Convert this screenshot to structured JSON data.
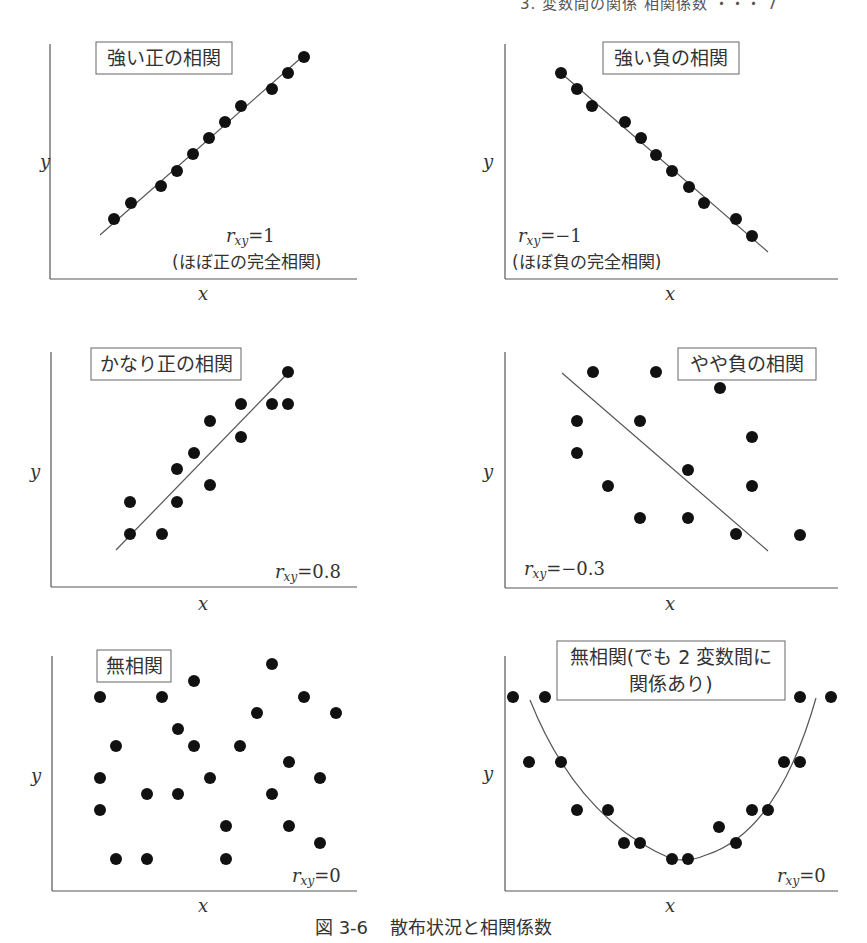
{
  "header": {
    "running_title": "3. 変数間の関係 相関係数 ・・・ 7"
  },
  "caption": {
    "number": "図 3-6",
    "text": "散布状況と相関係数"
  },
  "chart_data": [
    {
      "type": "scatter",
      "title": "強い正の相関",
      "annotation": "r_xy = 1",
      "annotation_sub": "(ほぼ正の完全相関)",
      "xlabel": "x",
      "ylabel": "y",
      "trend": "linear",
      "points_px": [
        [
          114,
          219
        ],
        [
          131,
          203
        ],
        [
          161,
          186
        ],
        [
          177,
          171
        ],
        [
          193,
          154
        ],
        [
          209,
          138
        ],
        [
          225,
          122
        ],
        [
          241,
          106
        ],
        [
          272,
          89
        ],
        [
          288,
          73
        ],
        [
          304,
          57
        ]
      ],
      "line_px": [
        [
          100,
          235
        ],
        [
          302,
          57
        ]
      ],
      "r_xy": 1
    },
    {
      "type": "scatter",
      "title": "強い負の相関",
      "annotation": "r_xy = −1",
      "annotation_sub": "(ほぼ負の完全相関)",
      "xlabel": "x",
      "ylabel": "y",
      "trend": "linear",
      "points_px": [
        [
          561,
          73
        ],
        [
          577,
          89
        ],
        [
          592,
          106
        ],
        [
          625,
          122
        ],
        [
          641,
          138
        ],
        [
          656,
          155
        ],
        [
          672,
          171
        ],
        [
          689,
          187
        ],
        [
          704,
          203
        ],
        [
          736,
          219
        ],
        [
          752,
          236
        ]
      ],
      "line_px": [
        [
          561,
          73
        ],
        [
          768,
          252
        ]
      ],
      "r_xy": -1
    },
    {
      "type": "scatter",
      "title": "かなり正の相関",
      "annotation": "r_xy = 0.8",
      "xlabel": "x",
      "ylabel": "y",
      "trend": "linear",
      "points_px": [
        [
          130,
          534
        ],
        [
          130,
          502
        ],
        [
          162,
          534
        ],
        [
          177,
          502
        ],
        [
          177,
          469
        ],
        [
          194,
          453
        ],
        [
          210,
          485
        ],
        [
          210,
          421
        ],
        [
          241,
          404
        ],
        [
          241,
          437
        ],
        [
          272,
          404
        ],
        [
          288,
          404
        ],
        [
          288,
          372
        ]
      ],
      "line_px": [
        [
          116,
          550
        ],
        [
          286,
          375
        ]
      ],
      "r_xy": 0.8
    },
    {
      "type": "scatter",
      "title": "やや負の相関",
      "annotation": "r_xy = −0.3",
      "xlabel": "x",
      "ylabel": "y",
      "trend": "linear",
      "points_px": [
        [
          593,
          372
        ],
        [
          656,
          372
        ],
        [
          720,
          388
        ],
        [
          577,
          421
        ],
        [
          640,
          421
        ],
        [
          752,
          437
        ],
        [
          577,
          453
        ],
        [
          608,
          486
        ],
        [
          688,
          470
        ],
        [
          752,
          486
        ],
        [
          640,
          518
        ],
        [
          688,
          518
        ],
        [
          736,
          534
        ],
        [
          800,
          535
        ]
      ],
      "line_px": [
        [
          562,
          373
        ],
        [
          768,
          551
        ]
      ],
      "r_xy": -0.3
    },
    {
      "type": "scatter",
      "title": "無相関",
      "annotation": "r_xy = 0",
      "xlabel": "x",
      "ylabel": "y",
      "trend": "none",
      "points_px": [
        [
          100,
          697
        ],
        [
          162,
          697
        ],
        [
          194,
          681
        ],
        [
          272,
          664
        ],
        [
          304,
          697
        ],
        [
          336,
          713
        ],
        [
          257,
          713
        ],
        [
          178,
          729
        ],
        [
          116,
          746
        ],
        [
          194,
          746
        ],
        [
          240,
          746
        ],
        [
          289,
          762
        ],
        [
          100,
          778
        ],
        [
          210,
          778
        ],
        [
          320,
          778
        ],
        [
          147,
          794
        ],
        [
          178,
          794
        ],
        [
          272,
          794
        ],
        [
          100,
          810
        ],
        [
          226,
          826
        ],
        [
          289,
          826
        ],
        [
          320,
          843
        ],
        [
          116,
          859
        ],
        [
          147,
          859
        ],
        [
          226,
          859
        ]
      ],
      "r_xy": 0
    },
    {
      "type": "scatter",
      "title": "無相関(でも 2 変数間に関係あり)",
      "title_lines": [
        "無相関(でも 2 変数間に",
        "関係あり)"
      ],
      "annotation": "r_xy = 0",
      "xlabel": "x",
      "ylabel": "y",
      "trend": "quadratic (U-shape)",
      "points_px": [
        [
          513,
          697
        ],
        [
          545,
          697
        ],
        [
          800,
          697
        ],
        [
          831,
          697
        ],
        [
          529,
          762
        ],
        [
          561,
          762
        ],
        [
          784,
          762
        ],
        [
          800,
          762
        ],
        [
          577,
          810
        ],
        [
          608,
          810
        ],
        [
          752,
          810
        ],
        [
          768,
          810
        ],
        [
          719,
          827
        ],
        [
          624,
          843
        ],
        [
          640,
          843
        ],
        [
          736,
          843
        ],
        [
          672,
          859
        ],
        [
          688,
          859
        ]
      ],
      "curve_px": [
        [
          530,
          700
        ],
        [
          680,
          860
        ],
        [
          816,
          698
        ]
      ],
      "r_xy": 0
    }
  ],
  "panels": {
    "p1": {
      "title": "強い正の相関",
      "r_label": "=1",
      "sub": "(ほぼ正の完全相関)"
    },
    "p2": {
      "title": "強い負の相関",
      "r_label": "=−1",
      "sub": "(ほぼ負の完全相関)"
    },
    "p3": {
      "title": "かなり正の相関",
      "r_label": "=0.8"
    },
    "p4": {
      "title": "やや負の相関",
      "r_label": "=−0.3"
    },
    "p5": {
      "title": "無相関",
      "r_label": "=0"
    },
    "p6": {
      "title_line1": "無相関(でも 2 変数間に",
      "title_line2": "関係あり)",
      "r_label": "=0"
    }
  },
  "axes": {
    "x": "x",
    "y": "y",
    "r_symbol": "r",
    "r_sub": "xy"
  },
  "colors": {
    "ink": "#111111",
    "axis": "#555555",
    "box": "#666666",
    "line": "#555555"
  }
}
